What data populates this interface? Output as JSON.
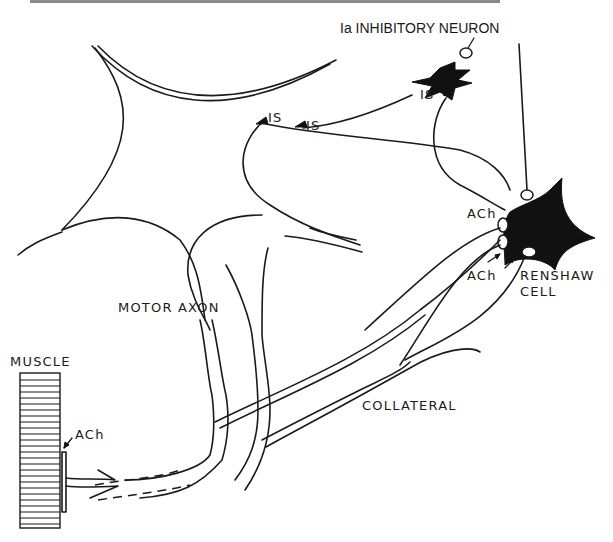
{
  "figure": {
    "title_fragment": "",
    "labels": {
      "ia_inhibitory_neuron": "Ia INHIBITORY NEURON",
      "is_upper": "IS",
      "is_lower": "IS",
      "is_inhibitory": "IS",
      "motoneurone": "MOTONEURONE",
      "motor_axon": "MOTOR AXON",
      "muscle": "MUSCLE",
      "ach_muscle": "ACh",
      "ach_renshaw_upper": "ACh",
      "ach_renshaw_lower": "ACh",
      "renshaw": "RENSHAW",
      "cell": "CELL",
      "collateral": "COLLATERAL"
    },
    "colors": {
      "ink": "#1a1a1a",
      "fill": "#111111",
      "background": "#ffffff"
    },
    "elements": [
      "motoneurone",
      "ia-inhibitory-neuron",
      "renshaw-cell",
      "motor-axons",
      "collateral",
      "muscle"
    ]
  }
}
